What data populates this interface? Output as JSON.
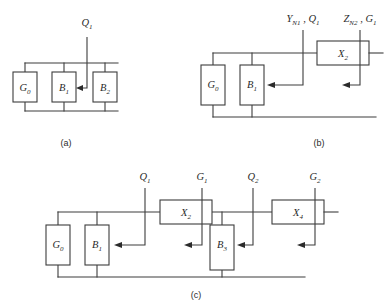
{
  "figure": {
    "title": "",
    "panels": [
      {
        "id": "a",
        "caption": "(a)",
        "blocks": [
          {
            "name": "G0",
            "base": "G",
            "sub": "0"
          },
          {
            "name": "B1",
            "base": "B",
            "sub": "1"
          },
          {
            "name": "B2",
            "base": "B",
            "sub": "2"
          }
        ],
        "terminals": [
          {
            "name": "Q1",
            "base": "Q",
            "sub": "1"
          }
        ]
      },
      {
        "id": "b",
        "caption": "(b)",
        "blocks": [
          {
            "name": "G0",
            "base": "G",
            "sub": "0"
          },
          {
            "name": "B1",
            "base": "B",
            "sub": "1"
          },
          {
            "name": "X2",
            "base": "X",
            "sub": "2"
          }
        ],
        "terminals": [
          {
            "name": "YN1_Q1",
            "parts": [
              {
                "base": "Y",
                "sub": "N1"
              },
              {
                "sep": " , "
              },
              {
                "base": "Q",
                "sub": "1"
              }
            ]
          },
          {
            "name": "ZN2_G1",
            "parts": [
              {
                "base": "Z",
                "sub": "N2"
              },
              {
                "sep": " , "
              },
              {
                "base": "G",
                "sub": "1"
              }
            ]
          }
        ]
      },
      {
        "id": "c",
        "caption": "(c)",
        "blocks": [
          {
            "name": "G0",
            "base": "G",
            "sub": "0"
          },
          {
            "name": "B1",
            "base": "B",
            "sub": "1"
          },
          {
            "name": "X2",
            "base": "X",
            "sub": "2"
          },
          {
            "name": "B3",
            "base": "B",
            "sub": "3"
          },
          {
            "name": "X4",
            "base": "X",
            "sub": "4"
          }
        ],
        "terminals": [
          {
            "name": "Q1",
            "base": "Q",
            "sub": "1"
          },
          {
            "name": "G1",
            "base": "G",
            "sub": "1"
          },
          {
            "name": "Q2",
            "base": "Q",
            "sub": "2"
          },
          {
            "name": "G2",
            "base": "G",
            "sub": "2"
          }
        ]
      }
    ],
    "colors": {
      "line": "#3c3c3c",
      "text": "#2b2b2b",
      "background": "#ffffff"
    }
  }
}
